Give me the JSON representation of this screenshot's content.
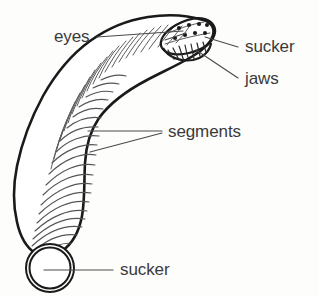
{
  "diagram": {
    "background_color": "#fdfdfc",
    "ink_color": "#1a1a1a",
    "label_color": "#3a3a3a",
    "labels": [
      {
        "id": "eyes",
        "text": "eyes",
        "x": 54,
        "y": 42
      },
      {
        "id": "sucker-head",
        "text": "sucker",
        "x": 245,
        "y": 52
      },
      {
        "id": "jaws",
        "text": "jaws",
        "x": 245,
        "y": 84
      },
      {
        "id": "segments",
        "text": "segments",
        "x": 168,
        "y": 137
      },
      {
        "id": "sucker-tail",
        "text": "sucker",
        "x": 120,
        "y": 275
      }
    ],
    "parts": [
      {
        "id": "eyes",
        "name": "eye spots",
        "count": 8
      },
      {
        "id": "head-sucker",
        "name": "anterior sucker"
      },
      {
        "id": "jaws",
        "name": "jaws"
      },
      {
        "id": "segments",
        "name": "body segments"
      },
      {
        "id": "tail-sucker",
        "name": "posterior sucker"
      }
    ]
  }
}
